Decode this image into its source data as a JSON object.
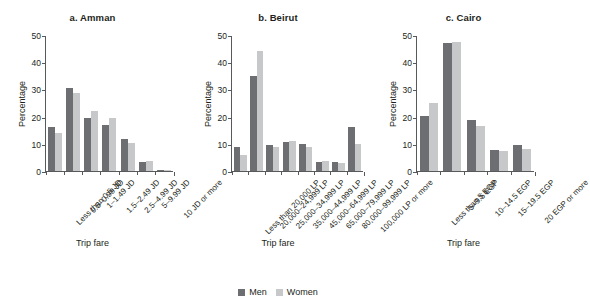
{
  "legend": {
    "entries": [
      {
        "label": "Men",
        "color": "#6d6e71"
      },
      {
        "label": "Women",
        "color": "#c7c8ca"
      }
    ]
  },
  "common": {
    "ylabel": "Percentage",
    "xlabel": "Trip fare",
    "yticks": [
      "0",
      "10",
      "20",
      "30",
      "40",
      "50"
    ]
  },
  "chart_data": [
    {
      "type": "bar",
      "title": "a. Amman",
      "xlabel": "Trip fare",
      "ylabel": "Percentage",
      "ylim": [
        0,
        50
      ],
      "ytick_values": [
        0,
        10,
        20,
        30,
        40,
        50
      ],
      "grid": false,
      "legend_position": "bottom-center-shared",
      "categories": [
        "Less than 0.5 JD",
        "0.5–0.99 JD",
        "1–1.49 JD",
        "1.5–2.49 JD",
        "2.5–4.99 JD",
        "5–9.99 JD",
        "10 JD or more"
      ],
      "series": [
        {
          "name": "Men",
          "color": "#6d6e71",
          "values": [
            16.3,
            30.6,
            19.4,
            16.9,
            11.6,
            3.2,
            0.4
          ]
        },
        {
          "name": "Women",
          "color": "#c7c8ca",
          "values": [
            14.0,
            28.5,
            22.0,
            19.4,
            10.4,
            3.6,
            0.4
          ]
        }
      ]
    },
    {
      "type": "bar",
      "title": "b. Beirut",
      "xlabel": "Trip fare",
      "ylabel": "Percentage",
      "ylim": [
        0,
        50
      ],
      "ytick_values": [
        0,
        10,
        20,
        30,
        40,
        50
      ],
      "grid": false,
      "legend_position": "bottom-center-shared",
      "categories": [
        "Less than 20,000 LP",
        "20,000–24,999 LP",
        "25,000–34,999 LP",
        "35,000–44,999 LP",
        "45,000–64,999 LP",
        "65,000–79,999 LP",
        "80,000–99,999 LP",
        "100,000 LP or more"
      ],
      "series": [
        {
          "name": "Men",
          "color": "#6d6e71",
          "values": [
            8.7,
            35.1,
            9.6,
            10.6,
            10.1,
            3.2,
            3.2,
            16.1
          ]
        },
        {
          "name": "Women",
          "color": "#c7c8ca",
          "values": [
            5.8,
            44.3,
            8.8,
            11.1,
            8.8,
            3.5,
            2.8,
            9.8
          ]
        }
      ]
    },
    {
      "type": "bar",
      "title": "c. Cairo",
      "xlabel": "Trip fare",
      "ylabel": "Percentage",
      "ylim": [
        0,
        50
      ],
      "ytick_values": [
        0,
        10,
        20,
        30,
        40,
        50
      ],
      "grid": false,
      "legend_position": "bottom-center-shared",
      "categories": [
        "Less than 5 EGP",
        "5–9.5 EGP",
        "10–14.5 EGP",
        "15–19.5 EGP",
        "20 EGP or more"
      ],
      "series": [
        {
          "name": "Men",
          "color": "#6d6e71",
          "values": [
            20.4,
            47.0,
            18.6,
            7.8,
            9.5
          ]
        },
        {
          "name": "Women",
          "color": "#c7c8ca",
          "values": [
            25.0,
            47.6,
            16.7,
            7.2,
            8.2
          ]
        }
      ]
    }
  ]
}
